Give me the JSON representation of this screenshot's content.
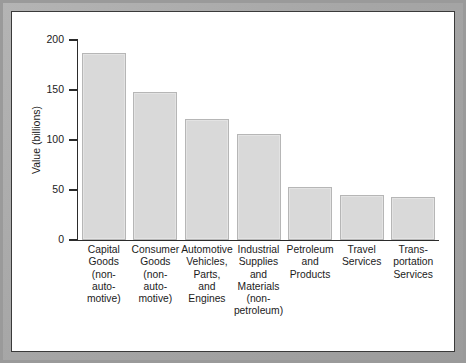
{
  "chart_data": {
    "type": "bar",
    "title": "",
    "xlabel": "",
    "ylabel": "Value (billions)",
    "ylim": [
      0,
      200
    ],
    "yticks": [
      0,
      50,
      100,
      150,
      200
    ],
    "ytick_labels": [
      "0",
      "50",
      "100",
      "150",
      "200"
    ],
    "grid": false,
    "legend": "none",
    "bar_color": "#d9d9d9",
    "bar_edge_color": "#b6b6b6",
    "axis_color": "#2b2b2b",
    "background_color": "#ffffff",
    "frame_color": "#a6a6a6",
    "categories": [
      "Capital\nGoods\n(non-\nauto-\nmotive)",
      "Consumer\nGoods\n(non-\nauto-\nmotive)",
      "Automotive\nVehicles,\nParts,\nand\nEngines",
      "Industrial\nSupplies\nand\nMaterials\n(non-\npetroleum)",
      "Petroleum\nand\nProducts",
      "Travel\nServices",
      "Trans-\nportation\nServices"
    ],
    "values": [
      187,
      148,
      121,
      106,
      53,
      45,
      43
    ]
  }
}
